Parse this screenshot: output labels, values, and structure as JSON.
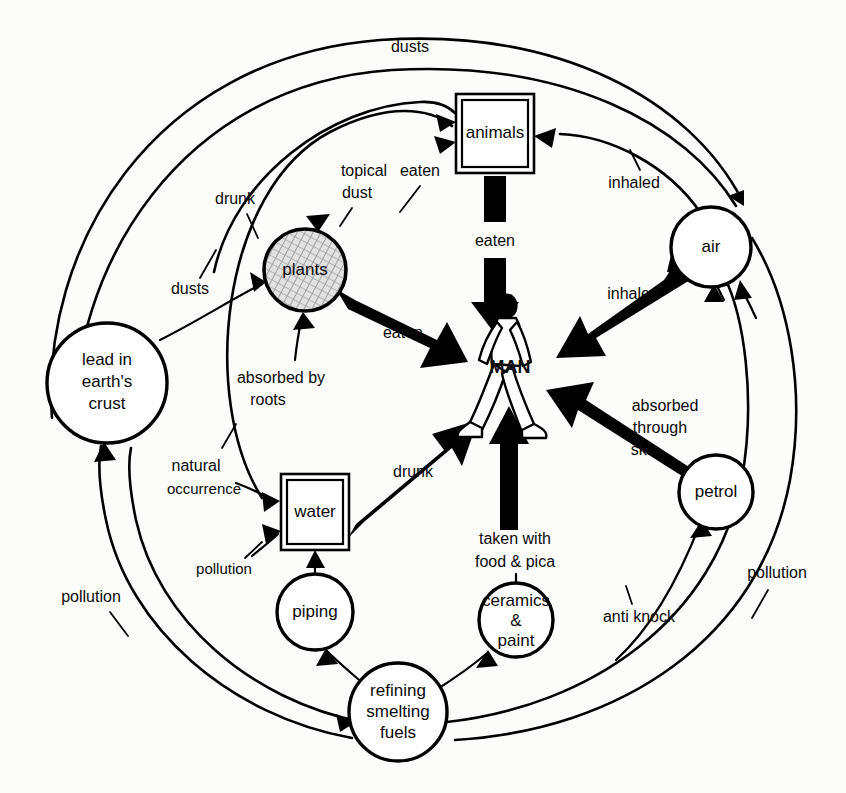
{
  "diagram": {
    "colors": {
      "ink": "#000000",
      "paper": "#fcfcfa",
      "node_fill": "#ffffff",
      "plants_texture": "#b9b9b9"
    },
    "nodes": [
      {
        "id": "lead-crust",
        "label": "lead in\nearth's\ncrust",
        "shape": "circle",
        "cx": 107,
        "cy": 383,
        "r": 60
      },
      {
        "id": "plants",
        "label": "plants",
        "shape": "circle-textured",
        "cx": 305,
        "cy": 270,
        "r": 41
      },
      {
        "id": "animals",
        "label": "animals",
        "shape": "double-rect",
        "x": 456,
        "y": 94,
        "w": 78,
        "h": 79
      },
      {
        "id": "air",
        "label": "air",
        "shape": "circle",
        "cx": 711,
        "cy": 247,
        "r": 40
      },
      {
        "id": "man",
        "label": "MAN",
        "shape": "figure",
        "cx": 510,
        "cy": 370
      },
      {
        "id": "water",
        "label": "water",
        "shape": "double-rect",
        "x": 281,
        "y": 474,
        "w": 68,
        "h": 76
      },
      {
        "id": "petrol",
        "label": "petrol",
        "shape": "circle",
        "cx": 716,
        "cy": 492,
        "r": 37
      },
      {
        "id": "piping",
        "label": "piping",
        "shape": "circle",
        "cx": 315,
        "cy": 612,
        "r": 38
      },
      {
        "id": "ceramics",
        "label": "ceramics\n&\npaint",
        "shape": "circle",
        "cx": 516,
        "cy": 620,
        "r": 37
      },
      {
        "id": "refining",
        "label": "refining\nsmelting\nfuels",
        "shape": "circle",
        "cx": 398,
        "cy": 712,
        "r": 49
      }
    ],
    "node_text": {
      "lead_crust_line1": "lead in",
      "lead_crust_line2": "earth's",
      "lead_crust_line3": "crust",
      "plants": "plants",
      "animals": "animals",
      "air": "air",
      "man": "MAN",
      "water": "water",
      "petrol": "petrol",
      "piping": "piping",
      "ceramics_line1": "ceramics",
      "ceramics_line2": "&",
      "ceramics_line3": "paint",
      "refining_line1": "refining",
      "refining_line2": "smelting",
      "refining_line3": "fuels"
    },
    "edge_labels": [
      {
        "id": "dusts-top",
        "text": "dusts",
        "x": 410,
        "y": 48,
        "from": "lead-crust",
        "to": "animals"
      },
      {
        "id": "topical-dust",
        "text": "topical",
        "x": 364,
        "y": 172,
        "from": "air",
        "to": "plants"
      },
      {
        "id": "topical-dust-2",
        "text": "dust",
        "x": 357,
        "y": 194,
        "from": "air",
        "to": "plants"
      },
      {
        "id": "eaten-plants-animals",
        "text": "eaten",
        "x": 420,
        "y": 172,
        "from": "plants",
        "to": "animals"
      },
      {
        "id": "drunk-animals",
        "text": "drunk",
        "x": 235,
        "y": 200,
        "from": "water",
        "to": "animals"
      },
      {
        "id": "inhaled-animals",
        "text": "inhaled",
        "x": 634,
        "y": 184,
        "from": "air",
        "to": "animals"
      },
      {
        "id": "eaten-animals-man",
        "text": "eaten",
        "x": 495,
        "y": 242,
        "from": "animals",
        "to": "man"
      },
      {
        "id": "inhaled-man",
        "text": "inhaled",
        "x": 633,
        "y": 295,
        "from": "air",
        "to": "man"
      },
      {
        "id": "dusts-left",
        "text": "dusts",
        "x": 190,
        "y": 290,
        "from": "lead-crust",
        "to": "plants"
      },
      {
        "id": "eaten-plants-man",
        "text": "eaten",
        "x": 403,
        "y": 334,
        "from": "plants",
        "to": "man"
      },
      {
        "id": "absorbed-by-roots-1",
        "text": "absorbed by",
        "x": 281,
        "y": 379,
        "from": "lead-crust",
        "to": "plants"
      },
      {
        "id": "absorbed-by-roots-2",
        "text": "roots",
        "x": 268,
        "y": 401,
        "from": "lead-crust",
        "to": "plants"
      },
      {
        "id": "natural-occurrence-1",
        "text": "natural",
        "x": 196,
        "y": 467,
        "from": "lead-crust",
        "to": "water"
      },
      {
        "id": "natural-occurrence-2",
        "text": "occurrence",
        "x": 200,
        "y": 490,
        "from": "lead-crust",
        "to": "water"
      },
      {
        "id": "drunk-water-man",
        "text": "drunk",
        "x": 413,
        "y": 473,
        "from": "water",
        "to": "man"
      },
      {
        "id": "absorbed-skin-1",
        "text": "absorbed",
        "x": 665,
        "y": 407,
        "from": "petrol",
        "to": "man"
      },
      {
        "id": "absorbed-skin-2",
        "text": "through",
        "x": 660,
        "y": 429,
        "from": "petrol",
        "to": "man"
      },
      {
        "id": "absorbed-skin-3",
        "text": "skin",
        "x": 645,
        "y": 451,
        "from": "petrol",
        "to": "man"
      },
      {
        "id": "pollution-water",
        "text": "pollution",
        "x": 221,
        "y": 570,
        "from": "refining",
        "to": "water"
      },
      {
        "id": "taken-with-1",
        "text": "taken with",
        "x": 515,
        "y": 540,
        "from": "ceramics",
        "to": "man"
      },
      {
        "id": "taken-with-2",
        "text": "food & pica",
        "x": 515,
        "y": 563,
        "from": "ceramics",
        "to": "man"
      },
      {
        "id": "pollution-left",
        "text": "pollution",
        "x": 91,
        "y": 598,
        "from": "refining",
        "to": "lead-crust"
      },
      {
        "id": "pollution-right",
        "text": "pollution",
        "x": 777,
        "y": 574,
        "from": "refining",
        "to": "air"
      },
      {
        "id": "anti-knock",
        "text": "anti knock",
        "x": 639,
        "y": 618,
        "from": "refining",
        "to": "petrol"
      }
    ]
  }
}
